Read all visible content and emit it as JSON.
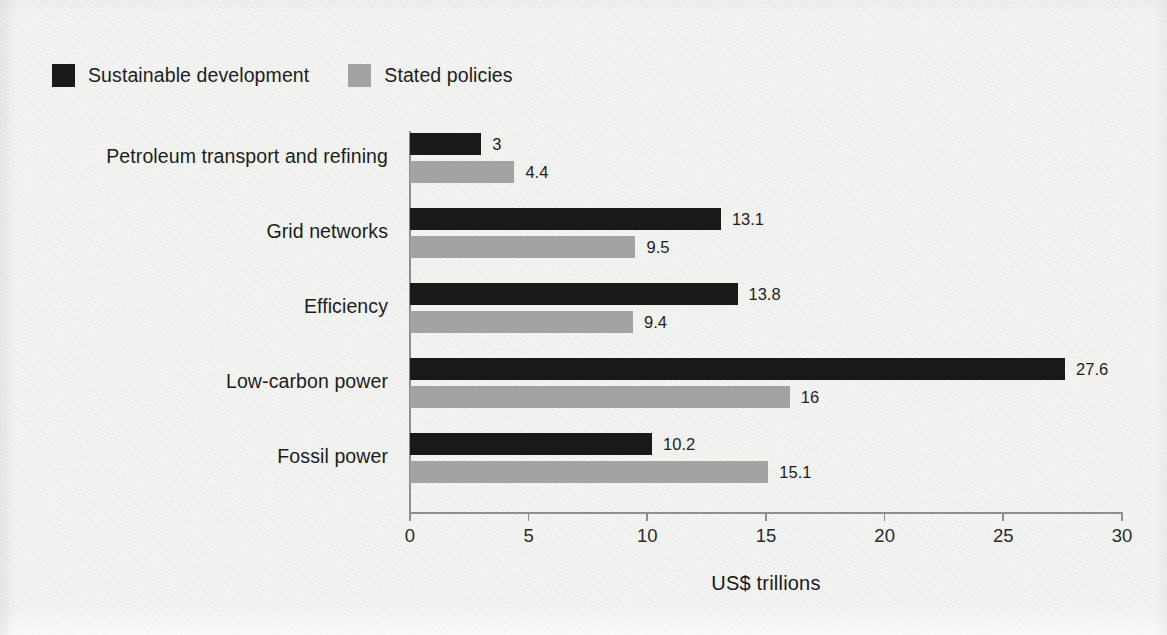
{
  "chart_data": {
    "type": "bar",
    "orientation": "horizontal",
    "title": "",
    "xlabel": "US$ trillions",
    "ylabel": "",
    "xlim": [
      0,
      30
    ],
    "xticks": [
      0,
      5,
      10,
      15,
      20,
      25,
      30
    ],
    "xtick_labels": [
      "0",
      "5",
      "10",
      "15",
      "20",
      "25",
      "30"
    ],
    "grid": false,
    "legend_position": "top-left",
    "categories": [
      "Petroleum transport and refining",
      "Grid networks",
      "Efficiency",
      "Low-carbon power",
      "Fossil power"
    ],
    "series": [
      {
        "name": "Sustainable development",
        "color": "#19191a",
        "values": [
          3,
          13.1,
          13.8,
          27.6,
          10.2
        ],
        "value_labels": [
          "3",
          "13.1",
          "13.8",
          "27.6",
          "10.2"
        ]
      },
      {
        "name": "Stated policies",
        "color": "#a3a3a3",
        "values": [
          4.4,
          9.5,
          9.4,
          16,
          15.1
        ],
        "value_labels": [
          "4.4",
          "9.5",
          "9.4",
          "16",
          "15.1"
        ]
      }
    ]
  },
  "colors": {
    "background": "#f3f3f1",
    "axis": "#8e8e8e",
    "text": "#1d1d1d",
    "series_dark": "#19191a",
    "series_light": "#a3a3a3"
  }
}
